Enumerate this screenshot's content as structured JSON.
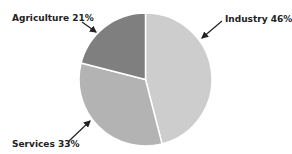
{
  "chart_data": {
    "type": "pie",
    "title": "",
    "categories": [
      "Industry",
      "Services",
      "Agriculture"
    ],
    "values": [
      46,
      33,
      21
    ],
    "unit": "%",
    "labels": [
      "Industry 46%",
      "Services 33%",
      "Agriculture 21%"
    ],
    "colors": [
      "#cdcdcd",
      "#b3b3b3",
      "#7f7f7f"
    ],
    "start_angle": "12 o'clock",
    "direction": "clockwise",
    "legend": "none (labels with arrows)"
  },
  "labels": {
    "industry": "Industry 46%",
    "services": "Services 33%",
    "agriculture": "Agriculture 21%"
  }
}
